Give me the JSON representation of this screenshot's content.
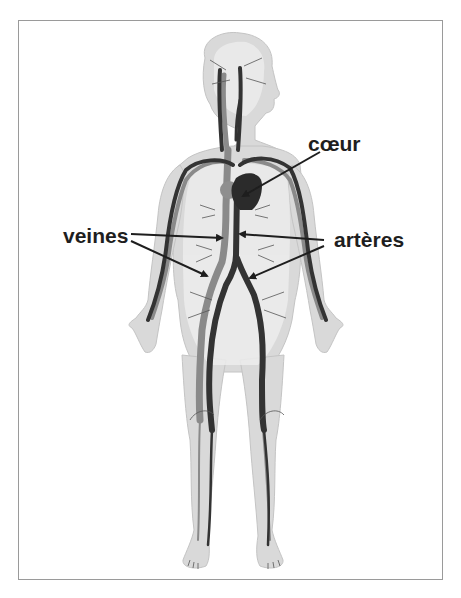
{
  "diagram": {
    "labels": {
      "heart": "cœur",
      "veins": "veines",
      "arteries": "artères"
    },
    "colors": {
      "background": "#ffffff",
      "frame_border": "#9a9a9a",
      "body_fill": "#d8d8d8",
      "body_inner": "#ececec",
      "artery_color": "#3a3a3a",
      "vein_color": "#8a8a8a",
      "arrow_color": "#1e1e1e",
      "label_color": "#1e1e1e"
    },
    "annotations": [
      {
        "label": "cœur",
        "points_to": "heart",
        "arrows": 1
      },
      {
        "label": "veines",
        "points_to": "vena cava (upper) and iliac vein (lower)",
        "arrows": 2
      },
      {
        "label": "artères",
        "points_to": "aorta (upper) and iliac artery (lower)",
        "arrows": 2
      }
    ]
  }
}
